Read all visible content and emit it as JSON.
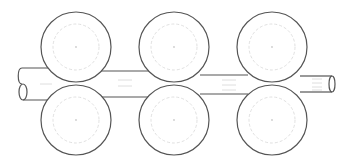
{
  "diagram": {
    "title": "",
    "colors": {
      "outline": "#555555",
      "pitch_circle": "#d8d8d8",
      "background": "#ffffff"
    },
    "rolls": [
      {
        "id": "top-1",
        "cx": 76,
        "cy": 47,
        "r": 35
      },
      {
        "id": "top-2",
        "cx": 174,
        "cy": 47,
        "r": 35
      },
      {
        "id": "top-3",
        "cx": 272,
        "cy": 47,
        "r": 35
      },
      {
        "id": "bottom-1",
        "cx": 76,
        "cy": 120,
        "r": 35
      },
      {
        "id": "bottom-2",
        "cx": 174,
        "cy": 120,
        "r": 35
      },
      {
        "id": "bottom-3",
        "cx": 272,
        "cy": 120,
        "r": 35
      }
    ],
    "stock_sections": [
      {
        "id": "entry",
        "top": 68,
        "bottom": 100
      },
      {
        "id": "pass-1",
        "top": 71,
        "bottom": 97
      },
      {
        "id": "pass-2",
        "top": 75,
        "bottom": 94
      },
      {
        "id": "exit",
        "top": 76,
        "bottom": 92
      }
    ]
  }
}
